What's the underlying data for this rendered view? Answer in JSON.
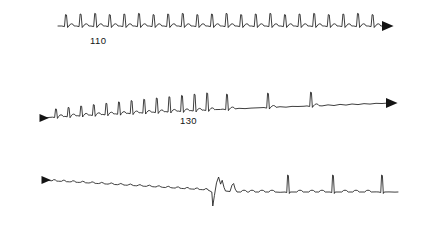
{
  "figure": {
    "background_color": "#ffffff",
    "trace_color": "#1c1c1c",
    "arrow_color": "#141414",
    "width": 427,
    "height": 227
  },
  "strips": [
    {
      "id": "strip-1",
      "label": "110",
      "label_x": 90,
      "label_y": 44,
      "baseline_y": 26,
      "start_x": 58,
      "end_x": 388,
      "left_arrow": false,
      "right_arrow": true,
      "right_arrow_x": 390,
      "right_arrow_y": 26,
      "description": "regular narrow-complex tachycardia, uniform tall R waves, flat baseline",
      "beat_count": 22,
      "first_beat_x": 66,
      "beat_spacing": 14.6,
      "r_amplitude": 12,
      "r_amplitude_jitter": 1.2,
      "t_amplitude": 2.2,
      "baseline_drift": 0
    },
    {
      "id": "strip-2",
      "label": "130",
      "label_x": 180,
      "label_y": 124,
      "baseline_y": 118,
      "start_x": 42,
      "end_x": 392,
      "left_arrow": true,
      "left_arrow_x": 40,
      "left_arrow_y": 118,
      "right_arrow": true,
      "right_arrow_x": 394,
      "right_arrow_y": 103,
      "description": "rapid closely-spaced beats of growing amplitude on a rising baseline, then slowing to widely spaced beats",
      "fast_beat_count": 13,
      "first_beat_x": 56,
      "fast_beat_spacing": 12.6,
      "fast_r_start_amplitude": 8,
      "fast_r_end_amplitude": 17,
      "slow_beats_x": [
        227,
        268,
        311
      ],
      "slow_r_amplitude": 15,
      "baseline_rise_total": 15,
      "t_amplitude": 1.8
    },
    {
      "id": "strip-3",
      "label": "",
      "baseline_y": 186,
      "start_x": 44,
      "end_x": 398,
      "left_arrow": true,
      "left_arrow_x": 42,
      "left_arrow_y": 186,
      "right_arrow": false,
      "description": "low-amplitude undulating baseline sloping downward, a wide biphasic complex with deep negative deflection and rounded hump, then isolated tall narrow spikes",
      "flutter_start_x": 52,
      "flutter_end_x": 208,
      "flutter_amplitude": 1.4,
      "flutter_wavelength": 9.5,
      "baseline_drop_total": 10,
      "wide_complex_x": 214,
      "wide_complex_negative_depth": 16,
      "wide_complex_hump_height": 13,
      "secondary_hump_x": 233,
      "secondary_hump_height": 8,
      "tall_spikes_x": [
        288,
        333,
        382
      ],
      "tall_spike_amplitude": 17,
      "small_bumps_x": [
        244,
        252,
        262,
        272,
        300,
        312,
        322,
        345,
        356,
        368
      ],
      "small_bump_amplitude": 1.8
    }
  ]
}
